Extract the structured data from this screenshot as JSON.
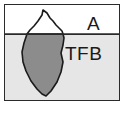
{
  "figure": {
    "name": "iceberg-diagram",
    "border_color": "#2b2b2b",
    "background": "#ffffff"
  },
  "zones": {
    "above_water": {
      "label": "A",
      "fill": "#ffffff"
    },
    "below_water": {
      "label": "TFB",
      "fill": "#e6e6e6"
    }
  },
  "iceberg": {
    "tip_name": "iceberg-tip",
    "tip_fill": "#ffffff",
    "submerged_name": "iceberg-submerged-mass",
    "submerged_fill": "#8c8c8c",
    "outline_color": "#1a1a1a"
  },
  "waterline": {
    "name": "waterline",
    "color": "#2b2b2b"
  }
}
